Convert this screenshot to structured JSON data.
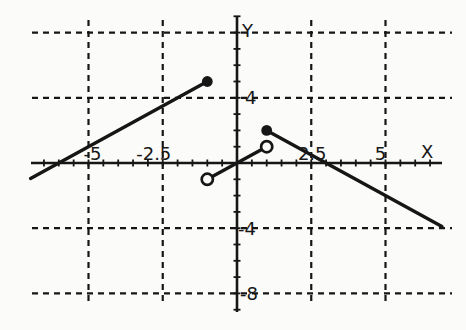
{
  "figure": {
    "paper_color": "#fbfbf9",
    "ink_color": "#161616",
    "width": 466,
    "height": 330
  },
  "chart_data": {
    "type": "line",
    "title": "",
    "xlabel": "X",
    "ylabel": "Y",
    "x_range": [
      -6.95,
      7.1
    ],
    "y_range": [
      -9.2,
      9.1
    ],
    "grid": {
      "style": "dashed",
      "x_gridlines": [
        -5,
        -2.5,
        2.5,
        5
      ],
      "y_gridlines": [
        8,
        4,
        -4,
        -8
      ]
    },
    "axis_ticks": {
      "x_step": 0.5,
      "x_min": -6.5,
      "x_max": 6.5,
      "y_step": 1,
      "y_min": -9,
      "y_max": 9
    },
    "tick_labels": {
      "x": [
        {
          "value": -5,
          "text": "-5"
        },
        {
          "value": -2.5,
          "text": "-2.5"
        },
        {
          "value": 2.5,
          "text": "2.5"
        },
        {
          "value": 5,
          "text": "5"
        }
      ],
      "y": [
        {
          "value": 4,
          "text": "4"
        },
        {
          "value": -4,
          "text": "-4"
        },
        {
          "value": -8,
          "text": "-8"
        }
      ]
    },
    "series": [
      {
        "name": "left-branch",
        "x": [
          -6.95,
          -1
        ],
        "y": [
          -0.95,
          5
        ]
      },
      {
        "name": "middle-branch",
        "x": [
          -1,
          1
        ],
        "y": [
          -1,
          1
        ]
      },
      {
        "name": "right-branch",
        "x": [
          1,
          6.9
        ],
        "y": [
          2,
          -3.9
        ]
      }
    ],
    "points": [
      {
        "x": -1,
        "y": 5,
        "style": "closed"
      },
      {
        "x": 1,
        "y": 2,
        "style": "closed"
      },
      {
        "x": -1,
        "y": -1,
        "style": "open"
      },
      {
        "x": 1,
        "y": 1,
        "style": "open"
      }
    ]
  }
}
